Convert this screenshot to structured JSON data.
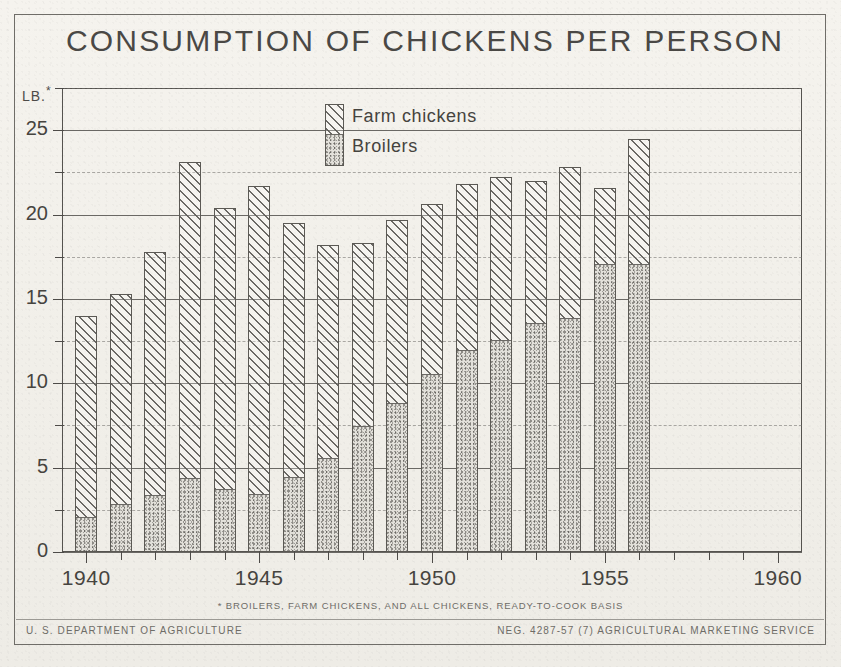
{
  "document": {
    "title": "CONSUMPTION OF CHICKENS PER PERSON",
    "y_axis_unit": "LB.",
    "y_axis_unit_marker": "*",
    "footnote": "* BROILERS, FARM CHICKENS, AND ALL CHICKENS, READY-TO-COOK BASIS",
    "footer_left": "U. S. DEPARTMENT OF AGRICULTURE",
    "footer_right": "NEG. 4287-57 (7)   AGRICULTURAL MARKETING SERVICE"
  },
  "legend": {
    "items": [
      {
        "label": "Farm chickens",
        "pattern": "diagonal-hatch"
      },
      {
        "label": "Broilers",
        "pattern": "stipple"
      }
    ]
  },
  "chart_data": {
    "type": "bar",
    "stacked": true,
    "title": "CONSUMPTION OF CHICKENS PER PERSON",
    "xlabel": "",
    "ylabel": "LB.*",
    "xlim": [
      1939.3,
      1960.7
    ],
    "ylim": [
      0,
      27.5
    ],
    "yticks": [
      0,
      5,
      10,
      15,
      20,
      25
    ],
    "yticklabels": [
      "0",
      "5",
      "10",
      "15",
      "20",
      "25"
    ],
    "yminorticks": [
      2.5,
      7.5,
      12.5,
      17.5,
      22.5,
      27.5
    ],
    "xticks": [
      1940,
      1945,
      1950,
      1955,
      1960
    ],
    "xticklabels": [
      "1940",
      "1945",
      "1950",
      "1955",
      "1960"
    ],
    "grid": true,
    "legend_position": "upper-center",
    "categories": [
      1940,
      1941,
      1942,
      1943,
      1944,
      1945,
      1946,
      1947,
      1948,
      1949,
      1950,
      1951,
      1952,
      1953,
      1954,
      1955,
      1956
    ],
    "series": [
      {
        "name": "Broilers",
        "values": [
          2.0,
          2.8,
          3.3,
          4.3,
          3.7,
          3.4,
          4.4,
          5.5,
          7.4,
          8.8,
          10.5,
          11.9,
          12.5,
          13.5,
          13.8,
          17.0,
          17.0
        ]
      },
      {
        "name": "Farm chickens",
        "values": [
          12.0,
          12.5,
          14.5,
          18.8,
          16.7,
          18.3,
          15.1,
          12.7,
          10.9,
          10.9,
          10.1,
          9.9,
          9.7,
          8.5,
          9.0,
          4.6,
          7.5
        ]
      }
    ],
    "totals": [
      14.0,
      15.3,
      17.8,
      23.1,
      20.4,
      21.7,
      19.5,
      18.2,
      18.3,
      19.7,
      20.6,
      21.8,
      22.2,
      22.0,
      22.8,
      21.6,
      24.5
    ]
  },
  "style": {
    "ink": "#4d4b48",
    "paper": "#f3f1ec",
    "grid": "#6a6864"
  }
}
